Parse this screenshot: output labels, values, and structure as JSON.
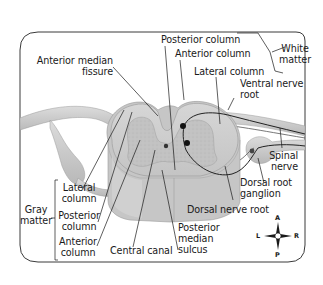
{
  "figure": {
    "type": "anatomical-diagram",
    "colors": {
      "frame": "#3a3a3a",
      "white_matter": "#cfcfcf",
      "gray_matter": "#bdbdbd",
      "nerve": "#c8c8c8",
      "leader_line": "#1a1a1a",
      "neuron_dot": "#111111"
    }
  },
  "labels": {
    "anterior_median_fissure": [
      "Anterior median",
      "fissure"
    ],
    "posterior_column_white": "Posterior column",
    "anterior_column_white": "Anterior column",
    "lateral_column_white": "Lateral column",
    "white_matter": [
      "White",
      "matter"
    ],
    "ventral_nerve_root": [
      "Ventral nerve",
      "root"
    ],
    "spinal_nerve": [
      "Spinal",
      "nerve"
    ],
    "dorsal_root_ganglion": [
      "Dorsal root",
      "ganglion"
    ],
    "dorsal_nerve_root": "Dorsal nerve root",
    "posterior_median_sulcus": [
      "Posterior",
      "median",
      "sulcus"
    ],
    "central_canal": "Central canal",
    "gray_matter": [
      "Gray",
      "matter"
    ],
    "lateral_column_gray": [
      "Lateral",
      "column"
    ],
    "posterior_column_gray": [
      "Posterior",
      "column"
    ],
    "anterior_column_gray": [
      "Anterior",
      "column"
    ]
  },
  "compass": {
    "icon": "orientation-compass-icon",
    "top": "A",
    "bottom": "P",
    "left": "L",
    "right": "R"
  }
}
